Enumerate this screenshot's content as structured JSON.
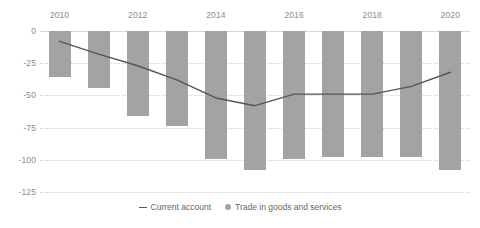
{
  "chart_data": {
    "type": "bar",
    "title": "",
    "subtitle": "",
    "xlabel": "",
    "ylabel": "",
    "xaxis_position": "top",
    "grid": true,
    "legend_position": "bottom",
    "ylim": [
      -125,
      0
    ],
    "yticks": [
      0,
      -25,
      -50,
      -75,
      -100,
      -125
    ],
    "ytick_labels": [
      "0",
      "-25",
      "-50",
      "-75",
      "-100",
      "-125"
    ],
    "categories": [
      2010,
      2011,
      2012,
      2013,
      2014,
      2015,
      2016,
      2017,
      2018,
      2019,
      2020
    ],
    "xtick_labels": [
      "2010",
      "2012",
      "2014",
      "2016",
      "2018",
      "2020"
    ],
    "xtick_values": [
      2010,
      2012,
      2014,
      2016,
      2018,
      2020
    ],
    "series": [
      {
        "name": "Trade in goods and services",
        "type": "bar",
        "color": "#a3a3a3",
        "values": [
          -36,
          -44,
          -66,
          -74,
          -99,
          -108,
          -99,
          -98,
          -98,
          -98,
          -108
        ]
      },
      {
        "name": "Current account",
        "type": "line",
        "color": "#555555",
        "values": [
          -8,
          -18,
          -27,
          -38,
          -52,
          -58,
          -49,
          -49,
          -49,
          -43,
          -32
        ]
      }
    ]
  },
  "legend": {
    "items": [
      {
        "marker": "line-marker",
        "label": "Current account"
      },
      {
        "marker": "dot-marker",
        "label": "Trade in goods and services"
      }
    ]
  },
  "colors": {
    "bar": "#a3a3a3",
    "line": "#555555",
    "grid": "#d2d2d2",
    "text": "#8c8c8c",
    "background": "#ffffff"
  }
}
